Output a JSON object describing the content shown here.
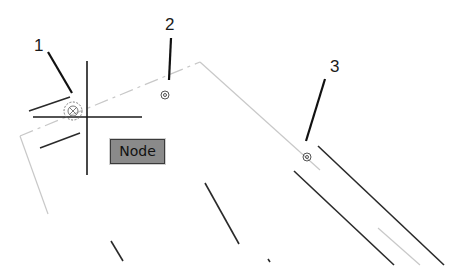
{
  "callouts": [
    {
      "number": "1",
      "target": "node-snap-marker-active"
    },
    {
      "number": "2",
      "target": "node-marker"
    },
    {
      "number": "3",
      "target": "node-marker"
    }
  ],
  "tooltip": {
    "label": "Node"
  },
  "colors": {
    "background": "#ffffff",
    "geometry": "#2a2a2a",
    "hidden_line": "#c8c8c8",
    "tooltip_bg": "#8a8a8a",
    "tooltip_border": "#3a3a3a",
    "callout_text": "#1a1a1a"
  }
}
